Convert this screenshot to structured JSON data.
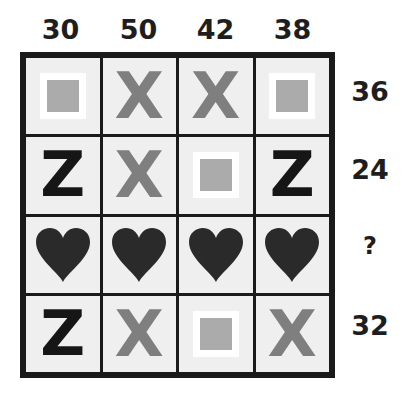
{
  "puzzle": {
    "column_sums": [
      "30",
      "50",
      "42",
      "38"
    ],
    "row_sums": [
      "36",
      "24",
      "?",
      "32"
    ],
    "grid": [
      [
        "square",
        "x",
        "x",
        "square"
      ],
      [
        "z",
        "x",
        "square",
        "z"
      ],
      [
        "heart",
        "heart",
        "heart",
        "heart"
      ],
      [
        "z",
        "x",
        "square",
        "x"
      ]
    ],
    "glyphs": {
      "x": "X",
      "z": "Z"
    },
    "colors": {
      "x": "#7f7f7f",
      "z": "#161616",
      "square_fill": "#ababab",
      "square_border": "#ffffff",
      "heart": "#2a2a2a",
      "cell_bg": "#efefef",
      "grid_line": "#1a1a1a"
    }
  }
}
